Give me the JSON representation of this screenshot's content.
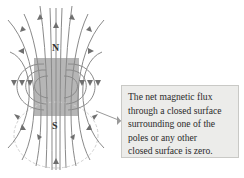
{
  "diagram": {
    "magnet": {
      "north_label": "N",
      "south_label": "S",
      "fill_color": "#a9a9a9"
    },
    "field_line_color": "#8a8a8a",
    "gaussian_surface_color": "#d0d0d0",
    "callout": {
      "lines": [
        "The net magnetic flux",
        "through a closed surface",
        "surrounding one of the",
        "poles or any other",
        "closed surface is zero."
      ],
      "background": "#ececea"
    }
  }
}
